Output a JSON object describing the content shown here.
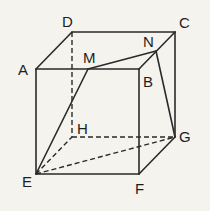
{
  "figure": {
    "type": "cube with points M on AB and N on BC",
    "vertices": {
      "A": {
        "label": "A",
        "x": 36,
        "y": 69
      },
      "B": {
        "label": "B",
        "x": 139,
        "y": 69
      },
      "C": {
        "label": "C",
        "x": 175,
        "y": 32
      },
      "D": {
        "label": "D",
        "x": 72,
        "y": 32
      },
      "E": {
        "label": "E",
        "x": 36,
        "y": 174
      },
      "F": {
        "label": "F",
        "x": 139,
        "y": 174
      },
      "G": {
        "label": "G",
        "x": 175,
        "y": 137
      },
      "H": {
        "label": "H",
        "x": 72,
        "y": 137
      },
      "M": {
        "label": "M",
        "x": 88,
        "y": 69
      },
      "N": {
        "label": "N",
        "x": 156,
        "y": 51
      }
    },
    "solid_edges": [
      "AB",
      "AD",
      "DC",
      "BC",
      "AE",
      "BF",
      "CG",
      "EF",
      "FG",
      "EM",
      "MN",
      "NG"
    ],
    "dashed_edges": [
      "DH",
      "HG",
      "EH",
      "EG"
    ],
    "labels": {
      "A": "A",
      "B": "B",
      "C": "C",
      "D": "D",
      "E": "E",
      "F": "F",
      "G": "G",
      "H": "H",
      "M": "M",
      "N": "N"
    }
  }
}
